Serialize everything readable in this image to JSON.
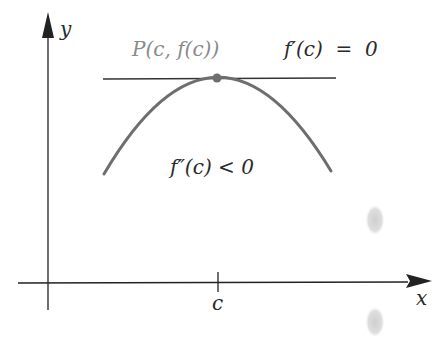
{
  "diagram": {
    "axes": {
      "x_label": "x",
      "y_label": "y",
      "tick_label": "c"
    },
    "point_label": "P(c, f(c))",
    "tangent_condition": "f′(c)  =  0",
    "concavity_condition": "f″(c) < 0",
    "colors": {
      "axis": "#222222",
      "curve": "#6e6e6e",
      "tangent": "#333333",
      "point": "#6e6e6e",
      "label_gray": "#8a8a8a",
      "smudge": "#d6d6d6"
    }
  }
}
